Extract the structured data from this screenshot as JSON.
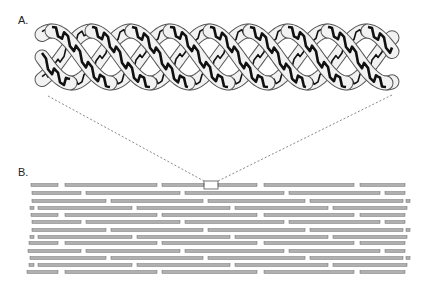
{
  "panels": {
    "a": {
      "label": "A.",
      "description": "triple-helix collagen molecule"
    },
    "b": {
      "label": "B.",
      "description": "staggered fibril array"
    }
  },
  "colors": {
    "strand_fill": "#f2f2f2",
    "strand_outline": "#555555",
    "backbone": "#111111",
    "rod_fill": "#b0b0b0",
    "rod_outline": "#666666",
    "dash": "#555555"
  },
  "helix": {
    "x_start": 42,
    "x_end": 392,
    "y_center": 57,
    "amplitude": 26,
    "period": 118,
    "strands": 3
  },
  "zoom_box": {
    "x": 204,
    "y": 181,
    "w": 14,
    "h": 8
  },
  "rod_rows": [
    {
      "y": 185,
      "segments": [
        [
          31,
          58
        ],
        [
          65,
          157
        ],
        [
          162,
          204
        ],
        [
          218,
          257
        ],
        [
          264,
          354
        ],
        [
          360,
          405
        ]
      ]
    },
    {
      "y": 193,
      "segments": [
        [
          32,
          81
        ],
        [
          86,
          180
        ],
        [
          185,
          284
        ],
        [
          289,
          380
        ],
        [
          385,
          405
        ]
      ]
    },
    {
      "y": 201,
      "segments": [
        [
          32,
          106
        ],
        [
          111,
          203
        ],
        [
          208,
          305
        ],
        [
          310,
          403
        ],
        [
          406,
          410
        ]
      ]
    },
    {
      "y": 208,
      "segments": [
        [
          30,
          34
        ],
        [
          38,
          132
        ],
        [
          137,
          230
        ],
        [
          235,
          328
        ],
        [
          333,
          407
        ]
      ]
    },
    {
      "y": 215,
      "segments": [
        [
          31,
          58
        ],
        [
          65,
          157
        ],
        [
          162,
          257
        ],
        [
          264,
          354
        ],
        [
          360,
          405
        ]
      ]
    },
    {
      "y": 222,
      "segments": [
        [
          32,
          81
        ],
        [
          86,
          180
        ],
        [
          185,
          284
        ],
        [
          289,
          380
        ],
        [
          385,
          405
        ]
      ]
    },
    {
      "y": 230,
      "segments": [
        [
          32,
          106
        ],
        [
          111,
          203
        ],
        [
          208,
          305
        ],
        [
          310,
          403
        ],
        [
          406,
          410
        ]
      ]
    },
    {
      "y": 237,
      "segments": [
        [
          30,
          34
        ],
        [
          38,
          132
        ],
        [
          137,
          230
        ],
        [
          235,
          328
        ],
        [
          333,
          407
        ]
      ]
    },
    {
      "y": 243,
      "segments": [
        [
          29,
          58
        ],
        [
          65,
          157
        ],
        [
          162,
          257
        ],
        [
          264,
          354
        ],
        [
          360,
          405
        ]
      ]
    },
    {
      "y": 251,
      "segments": [
        [
          28,
          81
        ],
        [
          86,
          180
        ],
        [
          185,
          284
        ],
        [
          289,
          380
        ],
        [
          385,
          405
        ]
      ]
    },
    {
      "y": 258,
      "segments": [
        [
          30,
          106
        ],
        [
          111,
          203
        ],
        [
          208,
          305
        ],
        [
          310,
          403
        ],
        [
          406,
          410
        ]
      ]
    },
    {
      "y": 265,
      "segments": [
        [
          29,
          34
        ],
        [
          38,
          132
        ],
        [
          137,
          230
        ],
        [
          235,
          328
        ],
        [
          333,
          407
        ]
      ]
    },
    {
      "y": 272,
      "segments": [
        [
          27,
          58
        ],
        [
          65,
          157
        ],
        [
          162,
          257
        ],
        [
          264,
          354
        ],
        [
          360,
          405
        ]
      ]
    }
  ]
}
